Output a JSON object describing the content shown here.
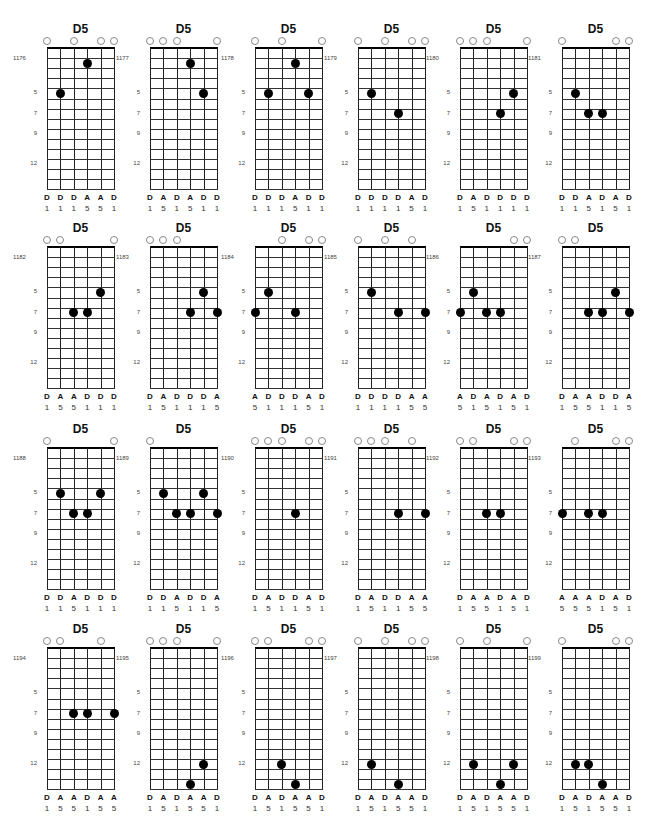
{
  "page": {
    "header": "",
    "fret_markers": [
      "5",
      "7",
      "9",
      "12"
    ]
  },
  "chords": [
    {
      "id": "1176",
      "name": "D5",
      "open": [
        1,
        3,
        5,
        6
      ],
      "dots": [
        [
          2,
          5
        ],
        [
          4,
          2
        ]
      ],
      "notes": [
        "D",
        "D",
        "D",
        "A",
        "A",
        "D"
      ],
      "degrees": [
        "1",
        "1",
        "1",
        "5",
        "5",
        "1"
      ]
    },
    {
      "id": "1177",
      "name": "D5",
      "open": [
        1,
        2,
        3,
        6
      ],
      "dots": [
        [
          4,
          2
        ],
        [
          5,
          5
        ]
      ],
      "notes": [
        "D",
        "A",
        "D",
        "A",
        "D",
        "D"
      ],
      "degrees": [
        "1",
        "5",
        "1",
        "5",
        "1",
        "1"
      ]
    },
    {
      "id": "1178",
      "name": "D5",
      "open": [
        1,
        3,
        6
      ],
      "dots": [
        [
          2,
          5
        ],
        [
          4,
          2
        ],
        [
          5,
          5
        ]
      ],
      "notes": [
        "D",
        "D",
        "D",
        "A",
        "D",
        "D"
      ],
      "degrees": [
        "1",
        "1",
        "1",
        "5",
        "1",
        "1"
      ]
    },
    {
      "id": "1179",
      "name": "D5",
      "open": [
        1,
        3,
        5,
        6
      ],
      "dots": [
        [
          2,
          5
        ],
        [
          4,
          7
        ]
      ],
      "notes": [
        "D",
        "D",
        "D",
        "D",
        "A",
        "D"
      ],
      "degrees": [
        "1",
        "1",
        "1",
        "1",
        "5",
        "1"
      ]
    },
    {
      "id": "1180",
      "name": "D5",
      "open": [
        1,
        2,
        3,
        6
      ],
      "dots": [
        [
          4,
          7
        ],
        [
          5,
          5
        ]
      ],
      "notes": [
        "D",
        "A",
        "D",
        "D",
        "D",
        "D"
      ],
      "degrees": [
        "1",
        "5",
        "1",
        "1",
        "1",
        "1"
      ]
    },
    {
      "id": "1181",
      "name": "D5",
      "open": [
        1,
        5,
        6
      ],
      "dots": [
        [
          2,
          5
        ],
        [
          3,
          7
        ],
        [
          4,
          7
        ]
      ],
      "notes": [
        "D",
        "D",
        "A",
        "D",
        "A",
        "D"
      ],
      "degrees": [
        "1",
        "1",
        "5",
        "1",
        "5",
        "1"
      ]
    },
    {
      "id": "1182",
      "name": "D5",
      "open": [
        1,
        2,
        6
      ],
      "dots": [
        [
          3,
          7
        ],
        [
          4,
          7
        ],
        [
          5,
          5
        ]
      ],
      "notes": [
        "D",
        "A",
        "A",
        "D",
        "D",
        "D"
      ],
      "degrees": [
        "1",
        "5",
        "5",
        "1",
        "1",
        "1"
      ]
    },
    {
      "id": "1183",
      "name": "D5",
      "open": [
        1,
        2,
        3
      ],
      "dots": [
        [
          4,
          7
        ],
        [
          5,
          5
        ],
        [
          6,
          7
        ]
      ],
      "notes": [
        "D",
        "A",
        "D",
        "D",
        "D",
        "A"
      ],
      "degrees": [
        "1",
        "5",
        "1",
        "1",
        "1",
        "5"
      ]
    },
    {
      "id": "1184",
      "name": "D5",
      "open": [
        3,
        5,
        6
      ],
      "dots": [
        [
          1,
          7
        ],
        [
          2,
          5
        ],
        [
          4,
          7
        ]
      ],
      "notes": [
        "A",
        "D",
        "D",
        "D",
        "A",
        "D"
      ],
      "degrees": [
        "5",
        "1",
        "1",
        "1",
        "5",
        "1"
      ]
    },
    {
      "id": "1185",
      "name": "D5",
      "open": [
        1,
        3,
        5
      ],
      "dots": [
        [
          2,
          5
        ],
        [
          4,
          7
        ],
        [
          6,
          7
        ]
      ],
      "notes": [
        "D",
        "D",
        "D",
        "D",
        "A",
        "A"
      ],
      "degrees": [
        "1",
        "1",
        "1",
        "1",
        "5",
        "5"
      ]
    },
    {
      "id": "1186",
      "name": "D5",
      "open": [
        5,
        6
      ],
      "dots": [
        [
          1,
          7
        ],
        [
          2,
          5
        ],
        [
          3,
          7
        ],
        [
          4,
          7
        ]
      ],
      "notes": [
        "A",
        "D",
        "A",
        "D",
        "A",
        "D"
      ],
      "degrees": [
        "5",
        "1",
        "5",
        "1",
        "5",
        "1"
      ]
    },
    {
      "id": "1187",
      "name": "D5",
      "open": [
        1,
        2
      ],
      "dots": [
        [
          3,
          7
        ],
        [
          4,
          7
        ],
        [
          5,
          5
        ],
        [
          6,
          7
        ]
      ],
      "notes": [
        "D",
        "A",
        "A",
        "D",
        "D",
        "A"
      ],
      "degrees": [
        "1",
        "5",
        "5",
        "1",
        "1",
        "5"
      ]
    },
    {
      "id": "1188",
      "name": "D5",
      "open": [
        1,
        6
      ],
      "dots": [
        [
          2,
          5
        ],
        [
          3,
          7
        ],
        [
          4,
          7
        ],
        [
          5,
          5
        ]
      ],
      "notes": [
        "D",
        "D",
        "A",
        "D",
        "D",
        "D"
      ],
      "degrees": [
        "1",
        "1",
        "5",
        "1",
        "1",
        "1"
      ]
    },
    {
      "id": "1189",
      "name": "D5",
      "open": [
        1
      ],
      "dots": [
        [
          2,
          5
        ],
        [
          3,
          7
        ],
        [
          4,
          7
        ],
        [
          5,
          5
        ],
        [
          6,
          7
        ]
      ],
      "notes": [
        "D",
        "D",
        "A",
        "D",
        "D",
        "A"
      ],
      "degrees": [
        "1",
        "1",
        "5",
        "1",
        "1",
        "5"
      ]
    },
    {
      "id": "1190",
      "name": "D5",
      "open": [
        1,
        2,
        3,
        5,
        6
      ],
      "dots": [
        [
          4,
          7
        ]
      ],
      "notes": [
        "D",
        "A",
        "D",
        "D",
        "A",
        "D"
      ],
      "degrees": [
        "1",
        "5",
        "1",
        "1",
        "5",
        "1"
      ]
    },
    {
      "id": "1191",
      "name": "D5",
      "open": [
        1,
        2,
        3,
        5
      ],
      "dots": [
        [
          4,
          7
        ],
        [
          6,
          7
        ]
      ],
      "notes": [
        "D",
        "A",
        "D",
        "D",
        "A",
        "A"
      ],
      "degrees": [
        "1",
        "5",
        "1",
        "1",
        "5",
        "5"
      ]
    },
    {
      "id": "1192",
      "name": "D5",
      "open": [
        1,
        2,
        5,
        6
      ],
      "dots": [
        [
          3,
          7
        ],
        [
          4,
          7
        ]
      ],
      "notes": [
        "D",
        "A",
        "A",
        "D",
        "A",
        "D"
      ],
      "degrees": [
        "1",
        "5",
        "5",
        "1",
        "5",
        "1"
      ]
    },
    {
      "id": "1193",
      "name": "D5",
      "open": [
        2,
        5,
        6
      ],
      "dots": [
        [
          1,
          7
        ],
        [
          3,
          7
        ],
        [
          4,
          7
        ]
      ],
      "notes": [
        "A",
        "A",
        "A",
        "D",
        "A",
        "D"
      ],
      "degrees": [
        "5",
        "5",
        "5",
        "1",
        "5",
        "1"
      ]
    },
    {
      "id": "1194",
      "name": "D5",
      "open": [
        1,
        2,
        5
      ],
      "dots": [
        [
          3,
          7
        ],
        [
          4,
          7
        ],
        [
          6,
          7
        ]
      ],
      "notes": [
        "D",
        "A",
        "A",
        "D",
        "A",
        "A"
      ],
      "degrees": [
        "1",
        "5",
        "5",
        "1",
        "5",
        "5"
      ]
    },
    {
      "id": "1195",
      "name": "D5",
      "open": [
        1,
        2,
        3,
        6
      ],
      "dots": [
        [
          4,
          14
        ],
        [
          5,
          12
        ]
      ],
      "notes": [
        "D",
        "A",
        "D",
        "A",
        "A",
        "D"
      ],
      "degrees": [
        "1",
        "5",
        "1",
        "5",
        "5",
        "1"
      ]
    },
    {
      "id": "1196",
      "name": "D5",
      "open": [
        1,
        2,
        5,
        6
      ],
      "dots": [
        [
          3,
          12
        ],
        [
          4,
          14
        ]
      ],
      "notes": [
        "D",
        "A",
        "D",
        "A",
        "A",
        "D"
      ],
      "degrees": [
        "1",
        "5",
        "1",
        "5",
        "5",
        "1"
      ]
    },
    {
      "id": "1197",
      "name": "D5",
      "open": [
        1,
        3,
        5,
        6
      ],
      "dots": [
        [
          2,
          12
        ],
        [
          4,
          14
        ]
      ],
      "notes": [
        "D",
        "A",
        "D",
        "A",
        "A",
        "D"
      ],
      "degrees": [
        "1",
        "5",
        "1",
        "5",
        "5",
        "1"
      ]
    },
    {
      "id": "1198",
      "name": "D5",
      "open": [
        1,
        3,
        6
      ],
      "dots": [
        [
          2,
          12
        ],
        [
          4,
          14
        ],
        [
          5,
          12
        ]
      ],
      "notes": [
        "D",
        "A",
        "D",
        "A",
        "A",
        "D"
      ],
      "degrees": [
        "1",
        "5",
        "1",
        "5",
        "5",
        "1"
      ]
    },
    {
      "id": "1199",
      "name": "D5",
      "open": [
        1,
        5,
        6
      ],
      "dots": [
        [
          2,
          12
        ],
        [
          3,
          12
        ],
        [
          4,
          14
        ]
      ],
      "notes": [
        "D",
        "A",
        "D",
        "A",
        "A",
        "D"
      ],
      "degrees": [
        "1",
        "5",
        "1",
        "5",
        "5",
        "1"
      ]
    }
  ]
}
